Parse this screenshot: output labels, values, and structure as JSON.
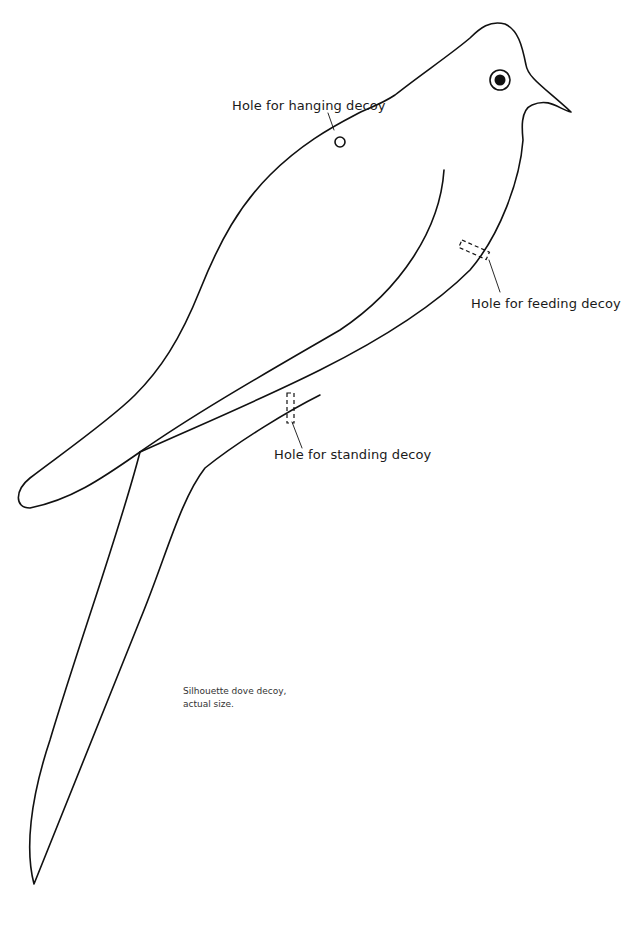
{
  "figure": {
    "labels": {
      "hanging": "Hole for hanging decoy",
      "feeding": "Hole for feeding decoy",
      "standing": "Hole for standing decoy"
    },
    "caption": {
      "line1": "Silhouette dove decoy,",
      "line2": "actual size."
    },
    "colors": {
      "line": "#111111",
      "background": "#ffffff"
    }
  }
}
